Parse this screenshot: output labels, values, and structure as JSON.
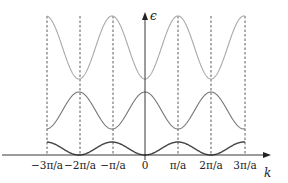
{
  "diagram": {
    "title": "",
    "y_axis_label": "ϵ",
    "x_axis_label": "k",
    "x_ticks": [
      "−3π/a",
      "−2π/a",
      "−π/a",
      "0",
      "π/a",
      "2π/a",
      "3π/a"
    ],
    "bands": [
      {
        "name": "band-1",
        "color": "#444444",
        "min_at": "k = 0, ±2π/a",
        "max_at": "k = ±π/a, ±3π/a"
      },
      {
        "name": "band-2",
        "color": "#777777",
        "min_at": "k = ±π/a, ±3π/a",
        "max_at": "k = 0, ±2π/a"
      },
      {
        "name": "band-3",
        "color": "#aaaaaa",
        "min_at": "k = 0, ±2π/a",
        "max_at": "k = ±π/a, ±3π/a"
      }
    ],
    "zone_boundaries": "dashed vertical lines at each tick"
  }
}
